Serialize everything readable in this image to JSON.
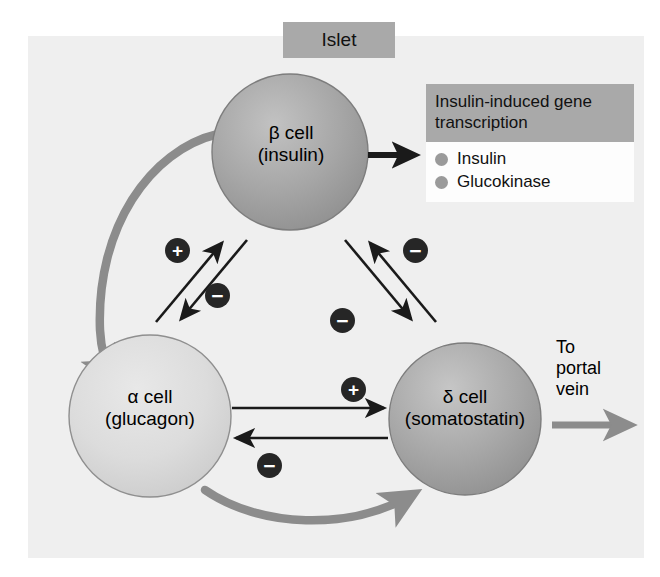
{
  "figure": {
    "title_box": {
      "label": "Islet"
    },
    "background_color": "#efefef",
    "cells": [
      {
        "id": "beta",
        "name": "β cell\n(insulin)",
        "greek": "β",
        "kind": "beta-cell",
        "hormone": "insulin",
        "fill": "#9e9e9e",
        "cx": 290,
        "cy": 152,
        "r": 78
      },
      {
        "id": "alpha",
        "name": "α cell\n(glucagon)",
        "greek": "α",
        "kind": "alpha-cell",
        "hormone": "glucagon",
        "fill": "#d6d6d6",
        "cx": 150,
        "cy": 416,
        "r": 81
      },
      {
        "id": "delta",
        "name": "δ cell\n(somatostatin)",
        "greek": "δ",
        "kind": "delta-cell",
        "hormone": "somatostatin",
        "fill": "#a3a3a3",
        "cx": 465,
        "cy": 419,
        "r": 76
      }
    ],
    "legend": {
      "header": "Insulin-induced gene\ntranscription",
      "items": [
        {
          "label": "Insulin",
          "dot_color": "#9a9a9a"
        },
        {
          "label": "Glucokinase",
          "dot_color": "#9a9a9a"
        }
      ]
    },
    "portal_vein": {
      "label": "To\nportal\nvein",
      "arrow_color": "#8c8c8c"
    },
    "signs": [
      {
        "id": "alpha-to-beta",
        "symbol": "+",
        "from": "alpha",
        "to": "beta",
        "x": 165,
        "y": 238
      },
      {
        "id": "beta-to-alpha",
        "symbol": "−",
        "from": "beta",
        "to": "alpha",
        "x": 205,
        "y": 283
      },
      {
        "id": "delta-to-beta",
        "symbol": "−",
        "from": "delta",
        "to": "beta",
        "x": 403,
        "y": 238
      },
      {
        "id": "beta-to-delta",
        "symbol": "−",
        "from": "beta",
        "to": "delta",
        "x": 330,
        "y": 308
      },
      {
        "id": "alpha-to-delta",
        "symbol": "+",
        "from": "alpha",
        "to": "delta",
        "x": 341,
        "y": 377
      },
      {
        "id": "delta-to-alpha",
        "symbol": "−",
        "from": "delta",
        "to": "alpha",
        "x": 257,
        "y": 453
      }
    ],
    "thin_arrow_color": "#1a1a1a",
    "thick_arrow_color": "#8c8c8c"
  }
}
